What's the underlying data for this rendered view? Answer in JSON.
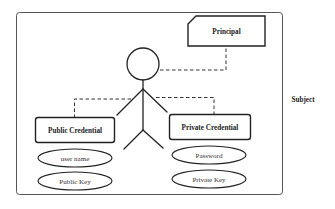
{
  "diagram": {
    "type": "uml-subject-model",
    "subject": {
      "label": "Subject"
    },
    "principal": {
      "label": "Principal"
    },
    "public_credential": {
      "label": "Public Credential",
      "attributes": [
        "user name",
        "Public Key"
      ]
    },
    "private_credential": {
      "label": "Private Credential",
      "attributes": [
        "Password",
        "Private Key"
      ]
    },
    "relations": [
      {
        "from": "subject",
        "to": "principal",
        "style": "dashed"
      },
      {
        "from": "subject",
        "to": "public_credential",
        "style": "dashed"
      },
      {
        "from": "subject",
        "to": "private_credential",
        "style": "dashed"
      }
    ]
  }
}
